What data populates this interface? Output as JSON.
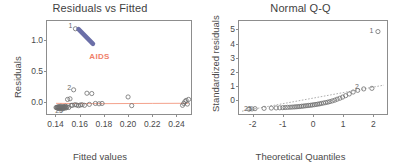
{
  "figure": {
    "panels": [
      {
        "id": "residuals-vs-fitted",
        "title": "Residuals vs Fitted",
        "xlabel": "Fitted values",
        "ylabel": "Residuals",
        "annotation": {
          "text": "AIDS",
          "color": "#f0806a"
        },
        "loess_color": "#f4a28c",
        "arrow_color": "#6b6fa8"
      },
      {
        "id": "normal-qq",
        "title": "Normal Q-Q",
        "xlabel": "Theoretical Quantiles",
        "ylabel": "Standardized residuals",
        "reference_line_color": "#9a9a9a"
      }
    ]
  },
  "chart_data": [
    {
      "type": "scatter",
      "title": "Residuals vs Fitted",
      "xlabel": "Fitted values",
      "ylabel": "Residuals",
      "xlim": [
        0.133,
        0.252
      ],
      "ylim": [
        -0.2,
        1.3
      ],
      "xticks": [
        0.14,
        0.16,
        0.18,
        0.2,
        0.22,
        0.24
      ],
      "xticklabels": [
        "0.14",
        "0.16",
        "0.18",
        "0.20",
        "0.22",
        "0.24"
      ],
      "yticks": [
        0.0,
        0.5,
        1.0
      ],
      "yticklabels": [
        "0.0",
        "0.5",
        "1.0"
      ],
      "grid": false,
      "legend": false,
      "annotations": [
        {
          "text": "AIDS",
          "x": 0.168,
          "y": 0.72,
          "color": "#f0806a"
        },
        {
          "text": "arrow",
          "x0": 0.171,
          "y0": 0.93,
          "x1": 0.159,
          "y1": 1.17,
          "color": "#6b6fa8"
        }
      ],
      "point_labels": [
        {
          "label": "1",
          "x": 0.1565,
          "y": 1.215
        },
        {
          "label": "2",
          "x": 0.1555,
          "y": 0.215
        },
        {
          "label": "25",
          "x": 0.1455,
          "y": -0.155
        }
      ],
      "x": [
        0.1405,
        0.141,
        0.1415,
        0.1418,
        0.1422,
        0.1425,
        0.1428,
        0.1432,
        0.1435,
        0.1438,
        0.1442,
        0.1445,
        0.1448,
        0.1452,
        0.1455,
        0.1458,
        0.1462,
        0.1465,
        0.1468,
        0.1472,
        0.1475,
        0.1478,
        0.1482,
        0.1485,
        0.149,
        0.1495,
        0.15,
        0.151,
        0.152,
        0.153,
        0.154,
        0.155,
        0.156,
        0.1575,
        0.159,
        0.1605,
        0.162,
        0.164,
        0.166,
        0.168,
        0.17,
        0.173,
        0.176,
        0.1785,
        0.2,
        0.203,
        0.245,
        0.246,
        0.247,
        0.248,
        0.249,
        0.25,
        0.1565
      ],
      "y": [
        -0.095,
        -0.1,
        -0.09,
        -0.105,
        -0.085,
        -0.11,
        -0.095,
        -0.08,
        -0.1,
        -0.115,
        -0.09,
        -0.075,
        -0.105,
        -0.095,
        -0.12,
        -0.085,
        -0.1,
        -0.11,
        -0.09,
        -0.08,
        -0.095,
        -0.105,
        -0.075,
        -0.09,
        -0.1,
        -0.085,
        0.035,
        -0.095,
        0.045,
        -0.06,
        -0.06,
        0.19,
        -0.05,
        -0.055,
        -0.065,
        -0.055,
        -0.05,
        -0.06,
        0.135,
        -0.045,
        0.13,
        -0.03,
        -0.035,
        -0.03,
        0.075,
        -0.065,
        -0.06,
        -0.03,
        0.0,
        0.02,
        -0.04,
        0.035,
        1.175
      ],
      "loess_line": {
        "x": [
          0.1405,
          0.16,
          0.18,
          0.2,
          0.22,
          0.25
        ],
        "y": [
          -0.028,
          -0.032,
          -0.033,
          -0.031,
          -0.029,
          -0.027
        ]
      }
    },
    {
      "type": "scatter",
      "title": "Normal Q-Q",
      "xlabel": "Theoretical Quantiles",
      "ylabel": "Standardized residuals",
      "xlim": [
        -2.45,
        2.45
      ],
      "ylim": [
        -1.0,
        5.6
      ],
      "xticks": [
        -2,
        -1,
        0,
        1,
        2
      ],
      "xticklabels": [
        "-2",
        "-1",
        "0",
        "1",
        "2"
      ],
      "yticks": [
        0,
        1,
        2,
        3,
        4,
        5
      ],
      "yticklabels": [
        "0",
        "1",
        "2",
        "3",
        "4",
        "5"
      ],
      "grid": false,
      "legend": false,
      "point_labels": [
        {
          "label": "1",
          "x": 2.1,
          "y": 4.88
        },
        {
          "label": "2",
          "x": 1.62,
          "y": 0.9
        },
        {
          "label": "25",
          "x": -2.05,
          "y": -0.62
        }
      ],
      "x": [
        -2.12,
        -2.02,
        -1.92,
        -1.62,
        -1.38,
        -1.22,
        -1.1,
        -1.0,
        -0.92,
        -0.84,
        -0.76,
        -0.69,
        -0.62,
        -0.56,
        -0.5,
        -0.44,
        -0.38,
        -0.32,
        -0.26,
        -0.2,
        -0.14,
        -0.08,
        -0.02,
        0.04,
        0.1,
        0.16,
        0.22,
        0.28,
        0.35,
        0.42,
        0.49,
        0.56,
        0.64,
        0.72,
        0.8,
        0.89,
        0.98,
        1.08,
        1.2,
        1.33,
        1.48,
        1.68,
        1.95,
        2.15
      ],
      "y": [
        -0.66,
        -0.64,
        -0.62,
        -0.6,
        -0.58,
        -0.57,
        -0.56,
        -0.55,
        -0.54,
        -0.53,
        -0.52,
        -0.51,
        -0.5,
        -0.49,
        -0.48,
        -0.47,
        -0.45,
        -0.44,
        -0.42,
        -0.41,
        -0.39,
        -0.38,
        -0.36,
        -0.34,
        -0.32,
        -0.3,
        -0.28,
        -0.25,
        -0.22,
        -0.19,
        -0.16,
        -0.12,
        -0.07,
        -0.02,
        0.05,
        0.12,
        0.2,
        0.3,
        0.42,
        0.56,
        0.68,
        0.78,
        0.82,
        4.85
      ],
      "reference_line": {
        "x": [
          -2.35,
          2.35
        ],
        "y": [
          -0.8,
          1.05
        ]
      }
    }
  ]
}
